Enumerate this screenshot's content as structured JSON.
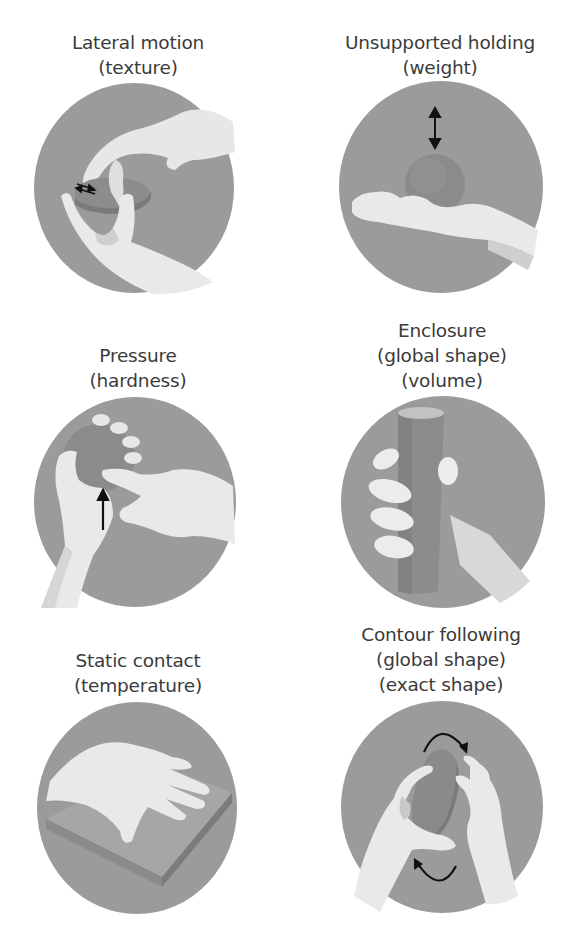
{
  "colors": {
    "background": "#ffffff",
    "circle": "#9b9b9b",
    "hand": "#e9e9e9",
    "hand_shadow": "#cfcfcf",
    "object": "#8a8a8a",
    "object_light": "#b5b5b5",
    "arrow": "#111111",
    "text": "#3b3b3b"
  },
  "panels": [
    {
      "id": "lateral-motion",
      "procedure": "Lateral motion",
      "properties": [
        "(texture)"
      ],
      "icon": "double-horizontal-arrow"
    },
    {
      "id": "unsupported-holding",
      "procedure": "Unsupported holding",
      "properties": [
        "(weight)"
      ],
      "icon": "vertical-double-arrow"
    },
    {
      "id": "pressure",
      "procedure": "Pressure",
      "properties": [
        "(hardness)"
      ],
      "icon": "up-arrow"
    },
    {
      "id": "enclosure",
      "procedure": "Enclosure",
      "properties": [
        "(global shape)",
        "(volume)"
      ],
      "icon": "none"
    },
    {
      "id": "static-contact",
      "procedure": "Static contact",
      "properties": [
        "(temperature)"
      ],
      "icon": "none"
    },
    {
      "id": "contour-following",
      "procedure": "Contour following",
      "properties": [
        "(global shape)",
        "(exact shape)"
      ],
      "icon": "curved-rotation-arrows"
    }
  ]
}
